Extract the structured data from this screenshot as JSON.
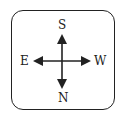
{
  "diagram": {
    "type": "compass",
    "labels": {
      "top": "S",
      "bottom": "N",
      "left": "E",
      "right": "W"
    },
    "colors": {
      "stroke": "#222222",
      "background": "#ffffff"
    }
  }
}
